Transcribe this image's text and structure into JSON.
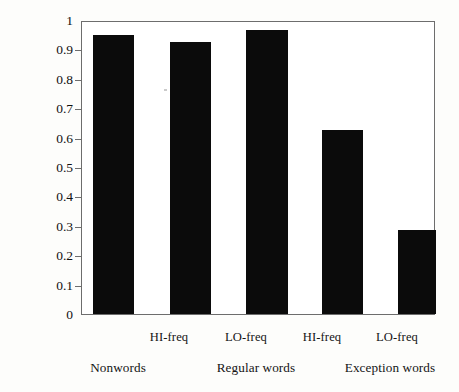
{
  "chart_data": {
    "type": "bar",
    "title": "",
    "xlabel": "",
    "ylabel": "Percentage correctly read out aloud",
    "ylim": [
      0,
      1
    ],
    "ytick_labels": [
      "0",
      "0.1",
      "0.2",
      "0.3",
      "0.4",
      "0.5",
      "0.6",
      "0.7",
      "0.8",
      "0.9",
      "1"
    ],
    "ytick_values": [
      0,
      0.1,
      0.2,
      0.3,
      0.4,
      0.5,
      0.6,
      0.7,
      0.8,
      0.9,
      1
    ],
    "grid": false,
    "legend": "none",
    "bar_color": "#0b0b0b",
    "axis_color": "#6d6d6d",
    "categories": [
      "Nonwords",
      "HI-freq",
      "LO-freq",
      "HI-freq",
      "LO-freq"
    ],
    "values": [
      0.95,
      0.925,
      0.965,
      0.625,
      0.285
    ],
    "bars": [
      {
        "label": "Nonwords",
        "sublabel": "",
        "group": "Nonwords",
        "value": 0.95
      },
      {
        "label": "HI-freq",
        "sublabel": "HI-freq",
        "group": "Regular words",
        "value": 0.925
      },
      {
        "label": "LO-freq",
        "sublabel": "LO-freq",
        "group": "Regular words",
        "value": 0.965
      },
      {
        "label": "HI-freq",
        "sublabel": "HI-freq",
        "group": "Exception words",
        "value": 0.625
      },
      {
        "label": "LO-freq",
        "sublabel": "LO-freq",
        "group": "Exception words",
        "value": 0.285
      }
    ],
    "sub_tick_labels": [
      "HI-freq",
      "LO-freq",
      "HI-freq",
      "LO-freq"
    ],
    "group_labels": [
      "Nonwords",
      "Regular words",
      "Exception words"
    ]
  },
  "axis": {
    "ylabel": "Percentage correctly read out aloud",
    "ytick_0": "0",
    "ytick_1": "0.1",
    "ytick_2": "0.2",
    "ytick_3": "0.3",
    "ytick_4": "0.4",
    "ytick_5": "0.5",
    "ytick_6": "0.6",
    "ytick_7": "0.7",
    "ytick_8": "0.8",
    "ytick_9": "0.9",
    "ytick_10": "1"
  },
  "xaxis": {
    "sub_1": "HI-freq",
    "sub_2": "LO-freq",
    "sub_3": "HI-freq",
    "sub_4": "LO-freq",
    "group_1": "Nonwords",
    "group_2": "Regular words",
    "group_3": "Exception words"
  }
}
